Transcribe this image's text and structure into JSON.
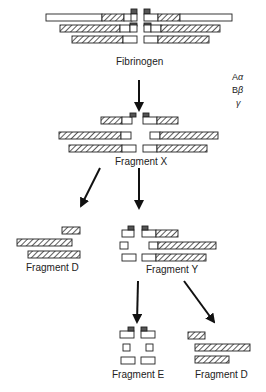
{
  "figure": {
    "labels": {
      "fibrinogen": "Fibrinogen",
      "fragment_x": "Fragment X",
      "fragment_d_left": "Fragment D",
      "fragment_y": "Fragment Y",
      "fragment_e": "Fragment E",
      "fragment_d_right": "Fragment D"
    },
    "legend": {
      "chain_a": "A",
      "chain_a_greek": "α",
      "chain_b": "B",
      "chain_b_greek": "β",
      "chain_g_greek": "γ"
    },
    "colors": {
      "outline": "#222222",
      "hatch": "#333333",
      "cap": "#555555",
      "background": "#ffffff"
    }
  }
}
